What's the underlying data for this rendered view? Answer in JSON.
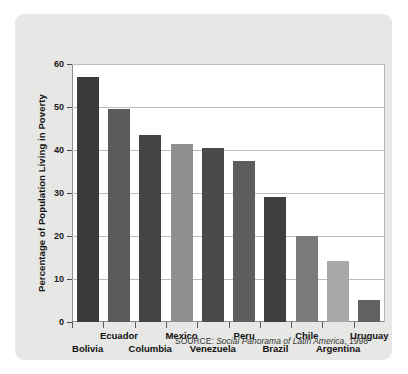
{
  "chart_data": {
    "type": "bar",
    "title": "",
    "xlabel": "",
    "ylabel": "Percentage of Population Living in Poverty",
    "ylim": [
      0,
      60
    ],
    "yticks": [
      0,
      10,
      20,
      30,
      40,
      50,
      60
    ],
    "ytick_labels": [
      "0",
      "10",
      "20",
      "30",
      "40",
      "50",
      "60"
    ],
    "grid": true,
    "legend": "none",
    "categories": [
      "Bolivia",
      "Ecuador",
      "Columbia",
      "Mexico",
      "Venezuela",
      "Peru",
      "Brazil",
      "Chile",
      "Argentina",
      "Uruguay"
    ],
    "values": [
      57,
      49.5,
      43.5,
      41.5,
      40.5,
      37.5,
      29,
      20,
      14.3,
      5.2
    ],
    "bar_colors": [
      "#3b3b3b",
      "#5b5b5b",
      "#434343",
      "#8f8f8f",
      "#4a4a4a",
      "#5e5e5e",
      "#3f3f3f",
      "#7b7b7b",
      "#a9a9a9",
      "#626262"
    ],
    "annotations": {
      "source": "SOURCE: Social Panorama of Latin America, 1998",
      "source_prefix": "SOURCE: ",
      "source_title": "Social Panorama of Latin America",
      "source_year": ", 1998"
    }
  },
  "figure": {
    "panel_background": "#e7e7e5",
    "plot_background": "#ffffff",
    "gridline_color": "#bdbdb9"
  }
}
